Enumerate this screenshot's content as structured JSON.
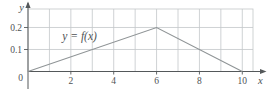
{
  "figure": {
    "background": "#ffffff"
  },
  "chart_data": {
    "type": "line",
    "title": "",
    "annotation": {
      "text": "y = f(x)",
      "x": 1.6,
      "y": 0.143
    },
    "series": [
      {
        "name": "f(x)",
        "points": [
          [
            0,
            0
          ],
          [
            6,
            0.2
          ],
          [
            10,
            0
          ]
        ]
      }
    ],
    "xlabel": "x",
    "ylabel": "y",
    "origin_label": "0",
    "x_ticks": [
      {
        "value": 2,
        "label": "2"
      },
      {
        "value": 4,
        "label": "4"
      },
      {
        "value": 6,
        "label": "6"
      },
      {
        "value": 8,
        "label": "8"
      },
      {
        "value": 10,
        "label": "10"
      }
    ],
    "y_ticks": [
      {
        "value": 0.1,
        "label": "0.1"
      },
      {
        "value": 0.2,
        "label": "0.2"
      }
    ],
    "xlim": [
      0,
      10.5
    ],
    "ylim": [
      0,
      0.284
    ],
    "x_grid_step": 1,
    "grid": true,
    "legend": "none",
    "colors": {
      "grid": "#c3c7c9",
      "axis": "#54585a",
      "curve": "#8f9496",
      "text": "#4e5254",
      "background": "#ffffff"
    }
  }
}
